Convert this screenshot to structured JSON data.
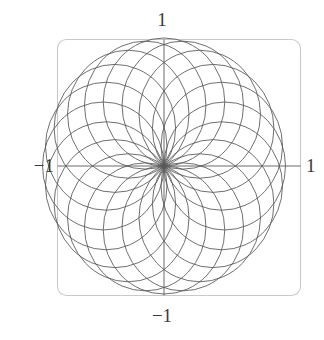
{
  "figure": {
    "type": "parametric-plot",
    "background_color": "#ffffff",
    "width": 324,
    "height": 340
  },
  "frame": {
    "name": "plot-frame",
    "stroke_color": "#c9c9c9",
    "stroke_width": 1.1,
    "corner_radius": 9,
    "x": 57.5,
    "y": 39.5,
    "width": 243,
    "height": 256
  },
  "axes": {
    "stroke_color": "#5a5a5a",
    "stroke_width": 0.9,
    "origin_x": 164,
    "origin_y": 166,
    "x_axis": {
      "name": "x-axis",
      "x1": 57.5,
      "y1": 166,
      "x2": 300.5,
      "y2": 166
    },
    "y_axis": {
      "name": "y-axis",
      "x1": 164,
      "y1": 39.5,
      "x2": 164,
      "y2": 295.5
    }
  },
  "labels": {
    "top": "1",
    "bottom": "−1",
    "left": "−1",
    "right": "1"
  },
  "chart_data": {
    "type": "line",
    "title": "",
    "subtitle": "",
    "xlabel": "",
    "ylabel": "",
    "xlim": [
      -1,
      1
    ],
    "ylim": [
      -1,
      1
    ],
    "xticks": [
      -1,
      1
    ],
    "yticks": [
      -1,
      1
    ],
    "xticklabels": [
      "−1",
      "1"
    ],
    "yticklabels": [
      "−1",
      "1"
    ],
    "grid": false,
    "legend": null,
    "annotations": [],
    "curve_family": {
      "name": "circles-through-origin",
      "count": 20,
      "center_locus_radius": 0.5,
      "circle_radius": 0.5,
      "angle_step_degrees": 18,
      "stroke_color": "#555555",
      "stroke_width": 0.85,
      "center_angles_degrees": [
        0,
        18,
        36,
        54,
        72,
        90,
        108,
        126,
        144,
        162,
        180,
        198,
        216,
        234,
        252,
        270,
        288,
        306,
        324,
        342
      ],
      "centers": [
        [
          0.5,
          0.0
        ],
        [
          0.4755,
          0.1545
        ],
        [
          0.4045,
          0.2939
        ],
        [
          0.2939,
          0.4045
        ],
        [
          0.1545,
          0.4755
        ],
        [
          0.0,
          0.5
        ],
        [
          -0.1545,
          0.4755
        ],
        [
          -0.2939,
          0.4045
        ],
        [
          -0.4045,
          0.2939
        ],
        [
          -0.4755,
          0.1545
        ],
        [
          -0.5,
          0.0
        ],
        [
          -0.4755,
          -0.1545
        ],
        [
          -0.4045,
          -0.2939
        ],
        [
          -0.2939,
          -0.4045
        ],
        [
          -0.1545,
          -0.4755
        ],
        [
          0.0,
          -0.5
        ],
        [
          0.1545,
          -0.4755
        ],
        [
          0.2939,
          -0.4045
        ],
        [
          0.4045,
          -0.2939
        ],
        [
          0.4755,
          -0.1545
        ]
      ]
    }
  }
}
